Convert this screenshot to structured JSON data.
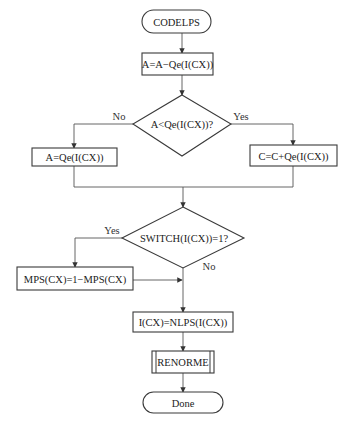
{
  "diagram": {
    "type": "flowchart",
    "colors": {
      "stroke": "#3a3a3a",
      "edge": "#555555",
      "text": "#222222",
      "background": "#ffffff"
    },
    "nodes": {
      "start": {
        "shape": "terminal",
        "label": "CODELPS"
      },
      "step_a_minus_qe": {
        "shape": "process",
        "label": "A=A−Qe(I(CX))"
      },
      "decision_a_lt_qe": {
        "shape": "decision",
        "label": "A<Qe(I(CX))?"
      },
      "step_a_eq_qe": {
        "shape": "process",
        "label": "A=Qe(I(CX))"
      },
      "step_c_plus_qe": {
        "shape": "process",
        "label": "C=C+Qe(I(CX))"
      },
      "decision_switch": {
        "shape": "decision",
        "label": "SWITCH(I(CX))=1?"
      },
      "step_mps_flip": {
        "shape": "process",
        "label": "MPS(CX)=1−MPS(CX)"
      },
      "step_nlps": {
        "shape": "process",
        "label": "I(CX)=NLPS(I(CX))"
      },
      "renorme": {
        "shape": "predefined-process",
        "label": "RENORME"
      },
      "end": {
        "shape": "terminal",
        "label": "Done"
      }
    },
    "edge_labels": {
      "decision1_no": "No",
      "decision1_yes": "Yes",
      "decision2_yes": "Yes",
      "decision2_no": "No"
    },
    "edges": [
      {
        "from": "start",
        "to": "step_a_minus_qe"
      },
      {
        "from": "step_a_minus_qe",
        "to": "decision_a_lt_qe"
      },
      {
        "from": "decision_a_lt_qe",
        "to": "step_a_eq_qe",
        "label": "No"
      },
      {
        "from": "decision_a_lt_qe",
        "to": "step_c_plus_qe",
        "label": "Yes"
      },
      {
        "from": "step_a_eq_qe",
        "to": "decision_switch"
      },
      {
        "from": "step_c_plus_qe",
        "to": "decision_switch"
      },
      {
        "from": "decision_switch",
        "to": "step_mps_flip",
        "label": "Yes"
      },
      {
        "from": "decision_switch",
        "to": "step_nlps",
        "label": "No"
      },
      {
        "from": "step_mps_flip",
        "to": "step_nlps"
      },
      {
        "from": "step_nlps",
        "to": "renorme"
      },
      {
        "from": "renorme",
        "to": "end"
      }
    ]
  }
}
